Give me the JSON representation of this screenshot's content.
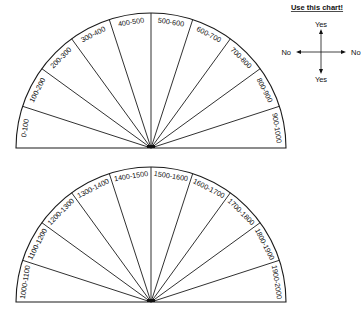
{
  "chart_data": {
    "type": "pendulum-chart",
    "charts": [
      {
        "name": "range-0-1000",
        "segments": [
          "0-100",
          "100-200",
          "200-300",
          "300-400",
          "400-500",
          "500-600",
          "600-700",
          "700-800",
          "800-900",
          "900-1000"
        ]
      },
      {
        "name": "range-1000-2000",
        "segments": [
          "1000-1100",
          "1100-1200",
          "1200-1300",
          "1300-1400",
          "1400-1500",
          "1500-1600",
          "1600-1700",
          "1700-1800",
          "1800-1900",
          "1900-2000"
        ]
      }
    ]
  },
  "legend": {
    "title": "Use this chart!",
    "up": "Yes",
    "down": "Yes",
    "left": "No",
    "right": "No"
  },
  "caption": "Graph No. Pendulum Chart"
}
